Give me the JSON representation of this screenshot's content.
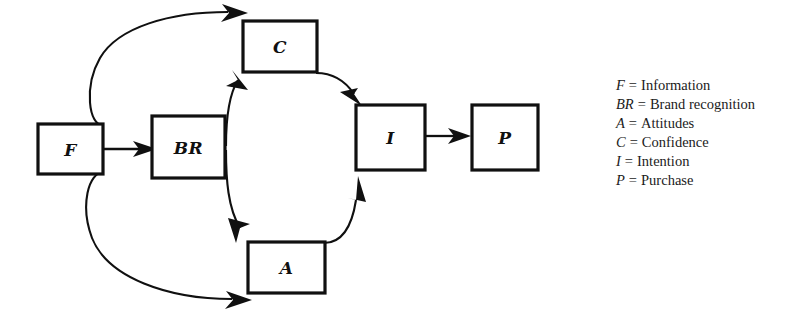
{
  "diagram": {
    "background_color": "#ffffff",
    "line_color": "#101010",
    "nodes": [
      {
        "id": "F",
        "label": "F",
        "x": 38,
        "y": 124,
        "w": 65,
        "h": 50
      },
      {
        "id": "BR",
        "label": "BR",
        "x": 152,
        "y": 116,
        "w": 73,
        "h": 62
      },
      {
        "id": "C",
        "label": "C",
        "x": 243,
        "y": 21,
        "w": 74,
        "h": 51
      },
      {
        "id": "A",
        "label": "A",
        "x": 248,
        "y": 242,
        "w": 77,
        "h": 51
      },
      {
        "id": "I",
        "label": "I",
        "x": 356,
        "y": 105,
        "w": 69,
        "h": 65
      },
      {
        "id": "P",
        "label": "P",
        "x": 472,
        "y": 105,
        "w": 66,
        "h": 65
      }
    ],
    "edges": [
      {
        "id": "f-br",
        "from": "F",
        "to": "BR",
        "kind": "straight"
      },
      {
        "id": "f-c",
        "from": "F",
        "to": "C",
        "kind": "curve-up"
      },
      {
        "id": "f-a",
        "from": "F",
        "to": "A",
        "kind": "curve-down"
      },
      {
        "id": "br-c",
        "from": "BR",
        "to": "C",
        "kind": "curve-up"
      },
      {
        "id": "br-a",
        "from": "BR",
        "to": "A",
        "kind": "curve-down"
      },
      {
        "id": "c-i",
        "from": "C",
        "to": "I",
        "kind": "curve-down"
      },
      {
        "id": "a-i",
        "from": "A",
        "to": "I",
        "kind": "curve-up"
      },
      {
        "id": "i-p",
        "from": "I",
        "to": "P",
        "kind": "straight"
      }
    ]
  },
  "legend": {
    "items": [
      {
        "symbol": "F",
        "equals": "=",
        "term": "Information"
      },
      {
        "symbol": "BR",
        "equals": "=",
        "term": "Brand recognition"
      },
      {
        "symbol": "A",
        "equals": "=",
        "term": "Attitudes"
      },
      {
        "symbol": "C",
        "equals": "=",
        "term": "Confidence"
      },
      {
        "symbol": "I",
        "equals": "=",
        "term": "Intention"
      },
      {
        "symbol": "P",
        "equals": "=",
        "term": "Purchase"
      }
    ]
  }
}
